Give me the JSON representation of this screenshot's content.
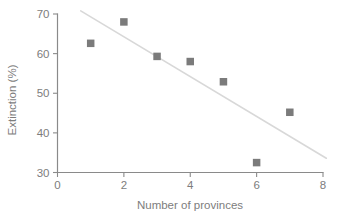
{
  "chart_data": {
    "type": "scatter",
    "title": "",
    "xlabel": "Number of provinces",
    "ylabel": "Extinction (%)",
    "xlim": [
      0,
      8
    ],
    "ylim": [
      30,
      70
    ],
    "xticks": [
      0,
      2,
      4,
      6,
      8
    ],
    "yticks": [
      30,
      40,
      50,
      60,
      70
    ],
    "xtick_labels": [
      "0",
      "2",
      "4",
      "6",
      "8"
    ],
    "ytick_labels": [
      "30",
      "40",
      "50",
      "60",
      "70"
    ],
    "grid": false,
    "legend": "none",
    "marker_shape": "square",
    "marker_color": "#7b7b7b",
    "trend_color": "#d8d8d8",
    "axis_color": "#8a8a8a",
    "text_color": "#7d7d7d",
    "x": [
      1,
      2,
      3,
      4,
      5,
      6,
      7
    ],
    "y": [
      62.6,
      68.0,
      59.3,
      58.0,
      52.9,
      32.5,
      45.2
    ],
    "points": [
      {
        "x": 1,
        "y": 62.6
      },
      {
        "x": 2,
        "y": 68.0
      },
      {
        "x": 3,
        "y": 59.3
      },
      {
        "x": 4,
        "y": 58.0
      },
      {
        "x": 5,
        "y": 52.9
      },
      {
        "x": 6,
        "y": 32.5
      },
      {
        "x": 7,
        "y": 45.2
      }
    ],
    "trendline": {
      "type": "linear",
      "x_start": 0.7,
      "y_start": 70.8,
      "x_end": 8.1,
      "y_end": 33.6,
      "slope": -5.03,
      "intercept": 74.3
    }
  },
  "axis_titles": {
    "x": "Number of provinces",
    "y": "Extinction (%)"
  }
}
